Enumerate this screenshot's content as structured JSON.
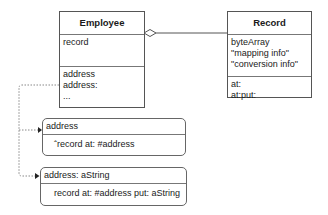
{
  "employee": {
    "title": "Employee",
    "attributes": [
      "record"
    ],
    "methods": [
      "address",
      "address:",
      "..."
    ]
  },
  "record": {
    "title": "Record",
    "attributes": [
      "byteArray",
      "\"mapping info\"",
      "\"conversion info\""
    ],
    "methods": [
      "at:",
      "at:put:"
    ]
  },
  "relationship": {
    "type": "aggregation",
    "from": "Employee",
    "to": "Record"
  },
  "method_notes": [
    {
      "signature": "address",
      "body": "ˆrecord at: #address"
    },
    {
      "signature": "address: aString",
      "body": "record at: #address put: aString"
    }
  ],
  "colors": {
    "line": "#555555",
    "dotted": "#888888",
    "background": "#ffffff"
  }
}
